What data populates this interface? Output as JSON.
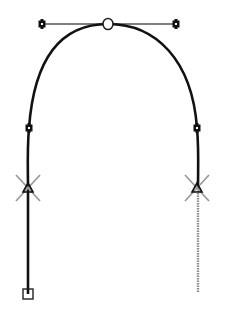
{
  "diagram": {
    "colors": {
      "path": "#111111",
      "handle_line": "#555555",
      "cross": "#9a9a9a",
      "dotted_segment": "#8a8a8a",
      "background": "#ffffff"
    },
    "path": {
      "d": "M 28 294 L 28 188 C 28 170 27 150 29 128 C 34 60 60 24 108 24 C 156 24 192 60 197 128 C 199 150 198 170 198 188"
    },
    "dotted_segment": {
      "x1": 198,
      "y1": 188,
      "x2": 198,
      "y2": 292
    },
    "handle_line": {
      "x1": 42,
      "y1": 24,
      "x2": 176,
      "y2": 24
    },
    "handles": [
      {
        "name": "left-top-handle",
        "x": 42,
        "y": 24
      },
      {
        "name": "right-top-handle",
        "x": 176,
        "y": 24
      },
      {
        "name": "left-side-handle",
        "x": 29,
        "y": 128
      },
      {
        "name": "right-side-handle",
        "x": 197,
        "y": 128
      }
    ],
    "top_anchor": {
      "x": 108,
      "y": 24,
      "shape": "open-circle"
    },
    "crossed_anchors": [
      {
        "name": "left-crossed-anchor",
        "x": 28,
        "y": 188
      },
      {
        "name": "right-crossed-anchor",
        "x": 197,
        "y": 188
      }
    ],
    "start_point": {
      "x": 28,
      "y": 294,
      "shape": "open-square"
    }
  }
}
